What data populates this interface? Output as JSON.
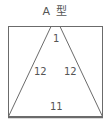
{
  "diagram": {
    "title": "A 型",
    "shape": "trapezoid inscribed in rectangle",
    "labels": {
      "top": "1",
      "left": "12",
      "right": "12",
      "bottom": "11"
    },
    "colors": {
      "stroke": "#6b6b6b",
      "text": "#555555"
    }
  }
}
